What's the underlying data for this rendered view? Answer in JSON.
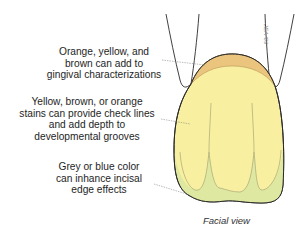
{
  "diagram": {
    "labels": [
      {
        "id": "gingival",
        "lines": [
          "Orange, yellow, and",
          "brown can add to",
          "gingival characterizations"
        ]
      },
      {
        "id": "body",
        "lines": [
          "Yellow, brown, or orange",
          "stains can provide check lines",
          "and add depth to",
          "developmental grooves"
        ]
      },
      {
        "id": "incisal",
        "lines": [
          "Grey or blue color",
          "can inhance incisal",
          "edge effects"
        ]
      }
    ],
    "caption": "Facial view",
    "signature": "JEA '89",
    "colors": {
      "gingival_zone": "#ebc57e",
      "body_zone": "#f8f0a0",
      "incisal_zone": "#dfe8a0",
      "outline": "#2a2a2a",
      "leader": "#777777"
    }
  }
}
